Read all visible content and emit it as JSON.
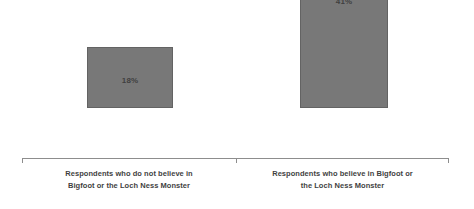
{
  "chart_data": {
    "type": "bar",
    "title": "",
    "subtitle": "",
    "xlabel": "",
    "ylabel": "",
    "categories": [
      "Respondents who do not believe in Bigfoot or the Loch Ness Monster",
      "Respondents who believe in Bigfoot or the Loch Ness Monster"
    ],
    "values": [
      18,
      41
    ],
    "value_labels": [
      "18%",
      "41%"
    ],
    "ylim": [
      0,
      44
    ],
    "grid": false,
    "legend": null,
    "axis_visible": true,
    "bar_color": "#787878",
    "bar_border_color": "#636363",
    "axis_color": "#8d8d8d",
    "label_color": "#3f3f3f"
  },
  "categories": [
    {
      "id": "non-believers",
      "value_label": "18%",
      "label_line_1": "Respondents who do not believe in",
      "label_line_2": "Bigfoot or the Loch Ness Monster"
    },
    {
      "id": "believers",
      "value_label": "41%",
      "label_line_1": "Respondents who believe in Bigfoot or",
      "label_line_2": "the Loch Ness Monster"
    }
  ]
}
